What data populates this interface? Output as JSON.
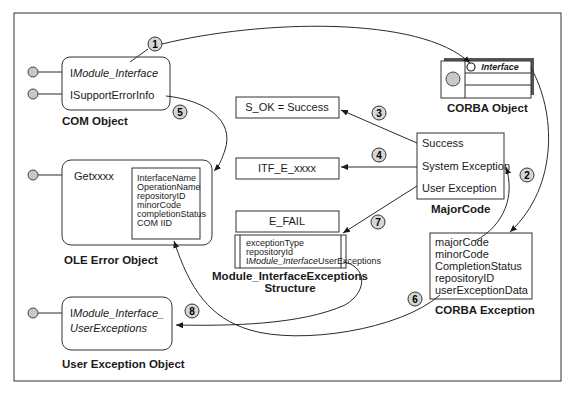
{
  "diagram": {
    "com_object": {
      "label": "COM Object",
      "interfaces": [
        {
          "prefix": "I",
          "name": "Module_Interface"
        },
        {
          "prefix": "",
          "name": "ISupportErrorInfo"
        }
      ]
    },
    "corba_object": {
      "label": "CORBA Object",
      "interface_label": "Interface"
    },
    "result_boxes": {
      "s_ok": "S_OK = Success",
      "itf_e": "ITF_E_xxxx",
      "e_fail": "E_FAIL"
    },
    "major_code": {
      "label": "MajorCode",
      "items": [
        "Success",
        "System Exception",
        "User Exception"
      ]
    },
    "ole_error_object": {
      "label": "OLE Error Object",
      "method": "Getxxxx",
      "fields": [
        "InterfaceName",
        "OperationName",
        "repositoryID",
        "minorCode",
        "completionStatus",
        "COM IID"
      ]
    },
    "exceptions_structure": {
      "label_line1": "Module_InterfaceExceptions",
      "label_line2": "Structure",
      "fields": [
        {
          "prefix": "",
          "text": "exceptionType"
        },
        {
          "prefix": "",
          "text": "repositoryId"
        },
        {
          "prefix": "I",
          "text": "Module_Interface",
          "suffix": "UserExceptions"
        }
      ]
    },
    "corba_exception": {
      "label": "CORBA Exception",
      "fields": [
        "majorCode",
        "minorCode",
        "CompletionStatus",
        "repositoryID",
        "userExceptionData"
      ]
    },
    "user_exception_object": {
      "label": "User Exception Object",
      "line1_prefix": "I",
      "line1": "Module_Interface_",
      "line2": "UserExceptions"
    },
    "callouts": [
      "1",
      "2",
      "3",
      "4",
      "5",
      "6",
      "7",
      "8"
    ],
    "colors": {
      "line": "#2a2a2a",
      "callout_fill": "#d6d6d6",
      "port_fill": "#c8c8c8",
      "corba_shadow": "#555555"
    }
  }
}
